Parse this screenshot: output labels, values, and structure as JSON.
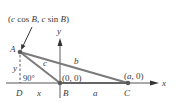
{
  "diagram": {
    "title_label": {
      "open": "(",
      "c1": "c",
      "cos": " cos ",
      "B1": "B",
      "comma": ", ",
      "c2": "c",
      "sin": " sin ",
      "B2": "B",
      "close": ")"
    },
    "points": {
      "A": "A",
      "B": "B",
      "C": "C",
      "D": "D"
    },
    "sides": {
      "a": "a",
      "b": "b",
      "c": "c",
      "x": "x",
      "y": "y"
    },
    "axes": {
      "x_label": "x",
      "y_label": "y"
    },
    "coords": {
      "origin": "(0, 0)",
      "C_open": "(",
      "C_a": "a",
      "C_rest": ", 0)"
    },
    "angle_label": "90°",
    "colors": {
      "triangle": "#7a7a7a",
      "axis": "#555555",
      "text": "#3a3a3a",
      "point": "#5a5a5a"
    }
  }
}
